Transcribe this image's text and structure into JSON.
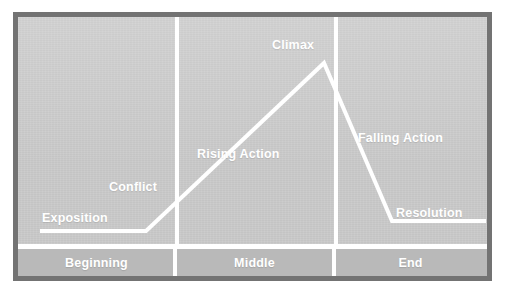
{
  "diagram": {
    "type": "narrative-arc",
    "background_color": "#c8c8c8",
    "frame_color": "#737373",
    "line_color": "#ffffff",
    "label_color": "#ffffff",
    "stage_band_color": "#b9b9b9",
    "curve_labels": [
      {
        "id": "exposition",
        "label": "Exposition"
      },
      {
        "id": "conflict",
        "label": "Conflict"
      },
      {
        "id": "rising-action",
        "label": "Rising Action"
      },
      {
        "id": "climax",
        "label": "Climax"
      },
      {
        "id": "falling-action",
        "label": "Falling Action"
      },
      {
        "id": "resolution",
        "label": "Resolution"
      }
    ],
    "stages": [
      {
        "id": "beginning",
        "label": "Beginning"
      },
      {
        "id": "middle",
        "label": "Middle"
      },
      {
        "id": "end",
        "label": "End"
      }
    ]
  },
  "chart_data": {
    "type": "line",
    "xlabel": "",
    "ylabel": "Dramatic Tension",
    "xlim": [
      0,
      469
    ],
    "ylim": [
      0,
      232
    ],
    "grid": false,
    "legend": null,
    "series": [
      {
        "name": "Narrative Arc",
        "color": "#ffffff",
        "points": [
          {
            "x": 24,
            "y": 214,
            "label": "Exposition"
          },
          {
            "x": 128,
            "y": 214,
            "label": "Conflict"
          },
          {
            "x": 306,
            "y": 46,
            "label": "Climax"
          },
          {
            "x": 374,
            "y": 204,
            "label": "Resolution"
          },
          {
            "x": 466,
            "y": 204,
            "label": ""
          }
        ]
      }
    ],
    "annotations": [
      {
        "text": "Exposition",
        "x": 24,
        "y": 194
      },
      {
        "text": "Conflict",
        "x": 91,
        "y": 163
      },
      {
        "text": "Rising Action",
        "x": 179,
        "y": 130
      },
      {
        "text": "Climax",
        "x": 254,
        "y": 21
      },
      {
        "text": "Falling Action",
        "x": 340,
        "y": 114
      },
      {
        "text": "Resolution",
        "x": 378,
        "y": 189
      }
    ],
    "act_dividers": [
      157,
      316
    ],
    "categories": [
      "Beginning",
      "Middle",
      "End"
    ]
  }
}
